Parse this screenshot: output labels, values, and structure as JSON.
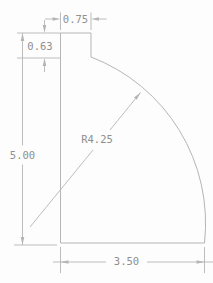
{
  "drawing": {
    "dimensions": {
      "top_width": "0.75",
      "notch_height": "0.63",
      "overall_height": "5.00",
      "base_width": "3.50",
      "arc_radius": "R4.25"
    },
    "colors": {
      "line": "#b5b5b5",
      "text": "#8f8f8f",
      "background": "#fdfdfd"
    }
  }
}
